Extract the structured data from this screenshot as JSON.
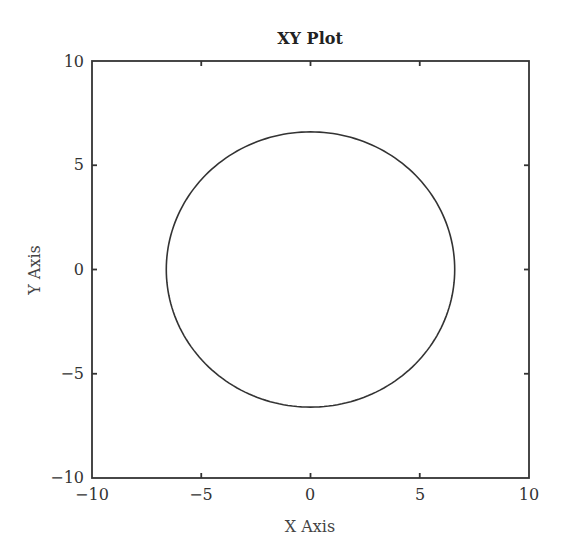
{
  "chart_data": {
    "type": "line",
    "title": "XY Plot",
    "xlabel": "X Axis",
    "ylabel": "Y Axis",
    "xlim": [
      -10,
      10
    ],
    "ylim": [
      -10,
      10
    ],
    "xticks": [
      "−10",
      "−5",
      "0",
      "5",
      "10"
    ],
    "yticks": [
      "−10",
      "−5",
      "0",
      "5",
      "10"
    ],
    "grid": false,
    "legend": null,
    "series": [
      {
        "name": "circle",
        "shape": "circle",
        "center": [
          0,
          0
        ],
        "radius": 6.6,
        "color": "#333333"
      }
    ]
  },
  "colors": {
    "line": "#333333",
    "axes": "#333333",
    "background": "#ffffff"
  }
}
